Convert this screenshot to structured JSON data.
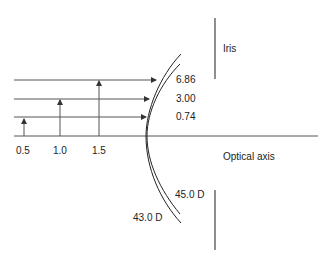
{
  "diagram": {
    "rays": [
      {
        "height_label": "0.5",
        "value": "0.74"
      },
      {
        "height_label": "1.0",
        "value": "3.00"
      },
      {
        "height_label": "1.5",
        "value": "6.86"
      }
    ],
    "labels": {
      "iris": "Iris",
      "optical_axis": "Optical axis",
      "inner_curve_power": "45.0 D",
      "outer_curve_power": "43.0 D"
    },
    "colors": {
      "line": "#333333",
      "text": "#222222",
      "background": "#ffffff"
    }
  }
}
